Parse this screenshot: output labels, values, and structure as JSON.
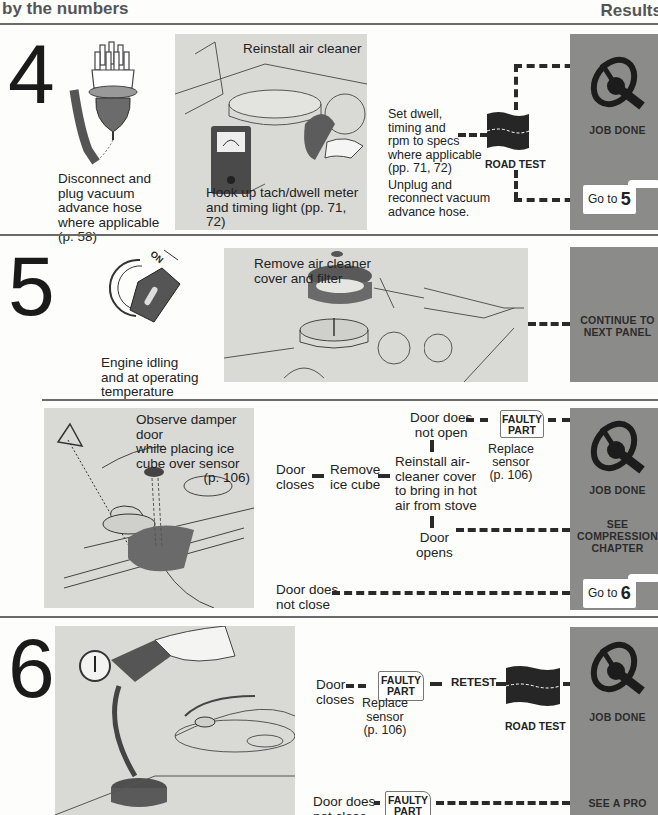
{
  "header": {
    "left_title_clipped": "Troubleshooting",
    "left_title": "by the numbers",
    "right_title": "Results"
  },
  "colors": {
    "results_panel": "#8b8b8a",
    "photo_bg": "#d9d9d6",
    "rule": "#6a6a6a",
    "text": "#222222"
  },
  "steps": [
    {
      "number": "4",
      "left_caption": [
        "Disconnect and",
        "plug vacuum",
        "advance hose",
        "where applicable",
        "(p. 58)"
      ],
      "photo_top_caption": "Reinstall air cleaner",
      "photo_bottom_caption": [
        "Hook up tach/dwell meter",
        "and timing light (pp. 71, 72)",
        "then run engine at idle"
      ],
      "action_text": [
        "Set dwell,",
        "timing and",
        " rpm to specs",
        "where applicable",
        "(pp. 71, 72)",
        "Unplug and",
        "reconnect vacuum",
        "advance hose."
      ],
      "road_test_label": "ROAD TEST",
      "results": {
        "job_done": "JOB DONE",
        "goto_prefix": "Go to",
        "goto_number": "5"
      }
    },
    {
      "number": "5",
      "left_caption": [
        "Engine idling",
        "and at operating",
        "temperature"
      ],
      "key_label": "ON",
      "photo_caption": [
        "Remove air cleaner",
        "cover and filter"
      ],
      "results": {
        "continue": [
          "CONTINUE TO",
          "NEXT PANEL"
        ]
      }
    },
    {
      "sub": "5b",
      "photo_caption": [
        "Observe damper door",
        "while placing ice",
        "cube over sensor",
        "(p. 106)"
      ],
      "door_closes": [
        "Door",
        "closes"
      ],
      "remove_ice": [
        "Remove",
        "ice cube"
      ],
      "reinstall": [
        "Reinstall air-",
        "cleaner cover",
        "to bring in hot",
        "air from stove"
      ],
      "door_not_open": [
        "Door does",
        "not open"
      ],
      "door_opens": [
        "Door",
        "opens"
      ],
      "door_not_close": [
        "Door does",
        "not close"
      ],
      "faulty_tag": [
        "FAULTY",
        "PART"
      ],
      "replace": [
        "Replace",
        "sensor",
        "(p. 106)"
      ],
      "results": {
        "job_done": "JOB DONE",
        "see_compression": [
          "SEE",
          "COMPRESSION",
          "CHAPTER"
        ],
        "goto_prefix": "Go to",
        "goto_number": "6"
      }
    },
    {
      "number": "6",
      "door_closes": [
        "Door",
        "closes"
      ],
      "faulty_tag": [
        "FAULTY",
        "PART"
      ],
      "replace": [
        "Replace",
        "sensor",
        "(p. 106)"
      ],
      "retest": "RETEST",
      "road_test_label": "ROAD TEST",
      "door_not_close": [
        "Door does",
        "not close"
      ],
      "faulty_tag_2": [
        "FAULTY",
        "PART"
      ],
      "results": {
        "job_done": "JOB DONE",
        "see_pro": "SEE A PRO"
      }
    }
  ]
}
